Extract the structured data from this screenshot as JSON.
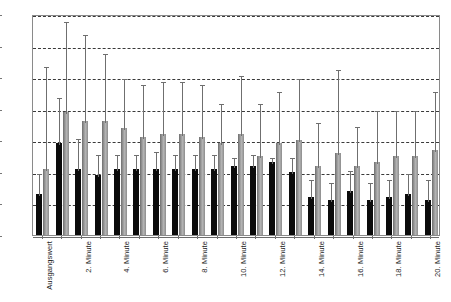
{
  "chart_data": {
    "type": "bar",
    "title": "",
    "xlabel": "",
    "ylabel": "",
    "ylim": [
      0,
      70
    ],
    "ytick_step": 10,
    "yticks": [
      0,
      10,
      20,
      30,
      40,
      50,
      60,
      70
    ],
    "grid": true,
    "grid_style": "dashed horizontal",
    "legend": null,
    "orientation": "vertical",
    "group_spacing": "grouped pairs with error bars",
    "error_bars": "upper only (mean + SD)",
    "categories": [
      "Ausgangswert",
      "1. Minute",
      "2. Minute",
      "3. Minute",
      "4. Minute",
      "5. Minute",
      "6. Minute",
      "7. Minute",
      "8. Minute",
      "9. Minute",
      "10. Minute",
      "11. Minute",
      "12. Minute",
      "13. Minute",
      "14. Minute",
      "15. Minute",
      "16. Minute",
      "17. Minute",
      "18. Minute",
      "19. Minute",
      "20. Minute"
    ],
    "visible_tick_labels": [
      "Ausgangswert",
      "2. Minute",
      "4. Minute",
      "6. Minute",
      "8. Minute",
      "10. Minute",
      "12. Minute",
      "14. Minute",
      "16. Minute",
      "18. Minute",
      "20. Minute"
    ],
    "series": [
      {
        "name": "black",
        "color": "#0b0b0b",
        "values": [
          13,
          29,
          21,
          19,
          21,
          21,
          21,
          21,
          21,
          21,
          22,
          22,
          23,
          20,
          12,
          11,
          14,
          11,
          12,
          13,
          11
        ],
        "errors_upper": [
          20,
          44,
          31,
          26,
          26,
          26,
          27,
          26,
          26,
          26,
          25,
          26,
          25,
          25,
          18,
          17,
          21,
          17,
          18,
          20,
          18
        ]
      },
      {
        "name": "grey",
        "color": "#9a9a9a",
        "values": [
          21,
          39,
          36,
          36,
          34,
          31,
          32,
          32,
          31,
          29,
          32,
          25,
          29,
          30,
          22,
          26,
          22,
          23,
          25,
          25,
          27
        ],
        "errors_upper": [
          54,
          68,
          64,
          58,
          50,
          48,
          49,
          49,
          48,
          42,
          51,
          42,
          46,
          50,
          36,
          53,
          35,
          40,
          40,
          40,
          46
        ]
      }
    ]
  }
}
